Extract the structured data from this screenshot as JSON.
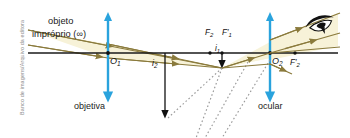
{
  "figure": {
    "kind": "optics-ray-diagram",
    "credit": "Banco de imagens/Arquivo da editora",
    "background": "#ffffff"
  },
  "colors": {
    "ray": "#8a7a3c",
    "ray_fill": "#f7f2d8",
    "lens": "#2aa3dd",
    "axis": "#1a1a1a",
    "image_arrow": "#111111",
    "virtual_dotted": "#9a9a9a",
    "text": "#1b1b1b",
    "credit_text": "#8d8d8d"
  },
  "labels": {
    "object": "objeto",
    "object_improper": "impróprio (∞)",
    "objective": "objetiva",
    "ocular": "ocular",
    "vertex_objective": "O",
    "vertex_objective_sub": "1",
    "vertex_ocular": "O",
    "vertex_ocular_sub": "2",
    "focus_F2": "F",
    "focus_F2_sub": "2",
    "focus_F1prime": "F",
    "focus_F1prime_sub": "1",
    "focus_F1prime_mark": "′",
    "focus_F2prime": "F",
    "focus_F2prime_sub": "2",
    "focus_F2prime_mark": "′",
    "image_i1": "i",
    "image_i1_sub": "1",
    "image_i2": "i",
    "image_i2_sub": "2"
  },
  "geometry": {
    "axis_y": 53,
    "axis_x_start": 28,
    "axis_x_end": 338,
    "objective_x": 108,
    "objective_top": 13,
    "objective_bottom": 99,
    "ocular_x": 270,
    "ocular_top": 13,
    "ocular_bottom": 99,
    "focal_point_F2_x": 210,
    "focal_point_F1prime_x": 222,
    "focal_point_F2prime_x": 295,
    "image_i1_tip_x": 222,
    "image_i1_tip_y": 68,
    "image_i2_x": 165,
    "image_i2_bottom_y": 120,
    "eye_x": 310,
    "eye_y": 25
  },
  "icons": {
    "eye": "eye-icon",
    "double_arrow_lens": "lens-double-arrow-icon",
    "ray_arrow": "ray-direction-arrow-icon"
  }
}
